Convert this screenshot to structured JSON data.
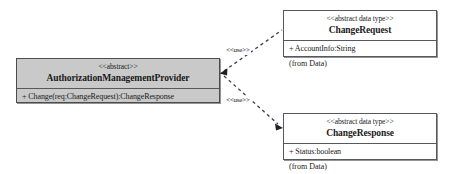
{
  "diagram": {
    "background_color": "#ffffff",
    "line_color": "#55585c",
    "shaded_fill": "#c9c9c9"
  },
  "classes": {
    "provider": {
      "stereotype": "<<abstract>>",
      "name": "AuthorizationManagementProvider",
      "members": [
        "+ Change(req:ChangeRequest):ChangeResponse"
      ],
      "fill": "#c9c9c9"
    },
    "change_request": {
      "stereotype": "<<abstract data type>>",
      "name": "ChangeRequest",
      "members": [
        "+ AccountInfo:String"
      ],
      "package_note": "(from Data)",
      "fill": "#ffffff"
    },
    "change_response": {
      "stereotype": "<<abstract data type>>",
      "name": "ChangeResponse",
      "members": [
        "+ Status:boolean"
      ],
      "package_note": "(from Data)",
      "fill": "#ffffff"
    }
  },
  "edges": {
    "use_request": {
      "label": "<<use>>",
      "style": "dashed",
      "from": "provider",
      "to": "change_request"
    },
    "use_response": {
      "label": "<<use>>",
      "style": "dashed",
      "from": "provider",
      "to": "change_response"
    }
  }
}
